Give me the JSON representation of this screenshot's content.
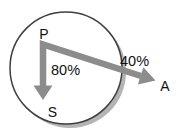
{
  "diagram": {
    "type": "arrow-diagram",
    "nodes": [
      {
        "id": "P",
        "label": "P"
      },
      {
        "id": "S",
        "label": "S"
      },
      {
        "id": "A",
        "label": "A"
      }
    ],
    "arrows": [
      {
        "from": "P",
        "to": "S",
        "label": "80%",
        "direction": "down"
      },
      {
        "from": "P",
        "to": "A",
        "label": "40%",
        "direction": "down-right, crossing circle boundary"
      }
    ],
    "colors": {
      "background": "#ffffff",
      "arrow": "#8c8c8c",
      "circle_fill": "#ffffff",
      "circle_stroke": "#3f3f3f",
      "circle_shadow": "#b4b4b4",
      "text": "#111111"
    }
  }
}
